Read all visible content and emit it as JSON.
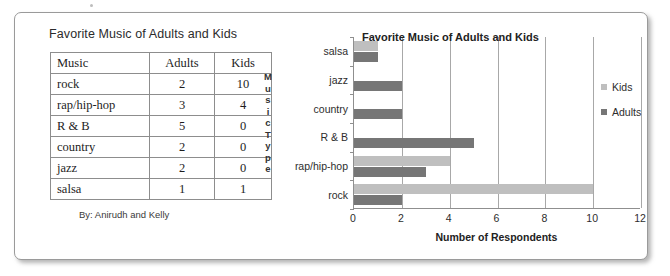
{
  "table_panel": {
    "title": "Favorite Music of Adults and Kids",
    "columns": [
      "Music",
      "Adults",
      "Kids"
    ],
    "rows": [
      {
        "music": "rock",
        "adults": "2",
        "kids": "10"
      },
      {
        "music": "rap/hip-hop",
        "adults": "3",
        "kids": "4"
      },
      {
        "music": "R & B",
        "adults": "5",
        "kids": "0"
      },
      {
        "music": "country",
        "adults": "2",
        "kids": "0"
      },
      {
        "music": "jazz",
        "adults": "2",
        "kids": "0"
      },
      {
        "music": "salsa",
        "adults": "1",
        "kids": "1"
      }
    ],
    "byline": "By: Anirudh and Kelly"
  },
  "chart_panel": {
    "y_axis_title_letters": [
      "M",
      "u",
      "s",
      "i",
      "c",
      "T",
      "y",
      "p",
      "e"
    ],
    "legend": [
      {
        "label": "Kids",
        "color": "#bfbfbf"
      },
      {
        "label": "Adults",
        "color": "#767676"
      }
    ]
  },
  "chart_data": {
    "type": "bar",
    "orientation": "horizontal",
    "title": "Favorite Music of Adults and Kids",
    "xlabel": "Number of Respondents",
    "ylabel": "Music Type",
    "categories": [
      "rock",
      "rap/hip-hop",
      "R & B",
      "country",
      "jazz",
      "salsa"
    ],
    "categories_top_to_bottom": [
      "salsa",
      "jazz",
      "country",
      "R & B",
      "rap/hip-hop",
      "rock"
    ],
    "series": [
      {
        "name": "Kids",
        "color": "#bfbfbf",
        "values": [
          10,
          4,
          0,
          0,
          0,
          1
        ]
      },
      {
        "name": "Adults",
        "color": "#767676",
        "values": [
          2,
          3,
          5,
          2,
          2,
          1
        ]
      }
    ],
    "xlim": [
      0,
      12
    ],
    "xticks": [
      0,
      2,
      4,
      6,
      8,
      10,
      12
    ],
    "grid": true,
    "legend_position": "right"
  }
}
